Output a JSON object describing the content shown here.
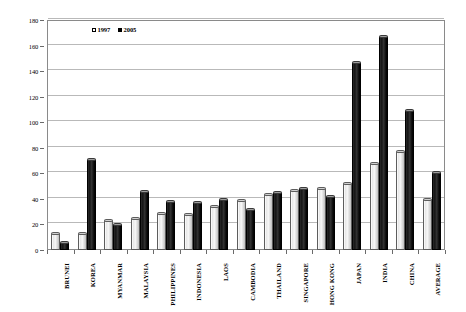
{
  "chart_data": {
    "type": "bar",
    "title": "",
    "subtitle": "",
    "xlabel": "",
    "ylabel": "",
    "ylim": [
      0,
      180
    ],
    "ytick_step": 20,
    "yticks": [
      "0",
      "20",
      "40",
      "60",
      "80",
      "100",
      "120",
      "140",
      "160",
      "180"
    ],
    "grid": true,
    "legend_position": "top-left-inside",
    "categories": [
      "BRUNEI",
      "KOREA",
      "MYANMAR",
      "MALAYSIA",
      "PHILIPPINES",
      "INDONESIA",
      "LAOS",
      "CAMBODIA",
      "THAILAND",
      "SINGAPORE",
      "HONG KONG",
      "JAPAN",
      "INDIA",
      "CHINA",
      "AVERAGE"
    ],
    "series": [
      {
        "name": "1997",
        "color": "#f2f2f2",
        "values": [
          14,
          14,
          24,
          26,
          30,
          29,
          35,
          40,
          45,
          48,
          49,
          53,
          69,
          78,
          41
        ]
      },
      {
        "name": "2005",
        "color": "#111111",
        "values": [
          7,
          72,
          21,
          47,
          39,
          38,
          41,
          33,
          46,
          49,
          43,
          148,
          168,
          110,
          62
        ]
      }
    ],
    "annotations": []
  },
  "legend": {
    "entries": [
      {
        "label": "1997",
        "swatch": "hollow-square"
      },
      {
        "label": "2005",
        "swatch": "filled-square"
      }
    ]
  },
  "colors": {
    "background": "#ffffff",
    "frame": "#8a8a8a",
    "gridline": "#b9b9b9",
    "series_1997": "#f2f2f2",
    "series_2005": "#111111",
    "text": "#000000"
  }
}
